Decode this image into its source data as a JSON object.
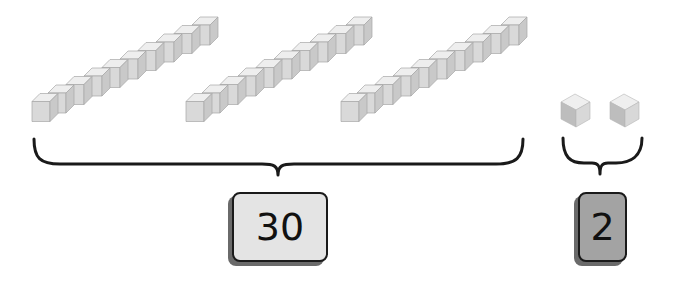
{
  "diagram": {
    "type": "place-value base-ten blocks",
    "groups": [
      {
        "name": "tens",
        "block_type": "rod",
        "count": 3,
        "units_per_block": 10,
        "label": "30",
        "label_fill": "#e4e4e4"
      },
      {
        "name": "ones",
        "block_type": "unit cube",
        "count": 2,
        "units_per_block": 1,
        "label": "2",
        "label_fill": "#a3a3a3"
      }
    ]
  },
  "colors": {
    "cube_top": "#efefef",
    "cube_front": "#dcdcdc",
    "cube_side": "#c4c4c4",
    "cube_edge": "#9a9a9a",
    "brace": "#1a1a1a"
  }
}
